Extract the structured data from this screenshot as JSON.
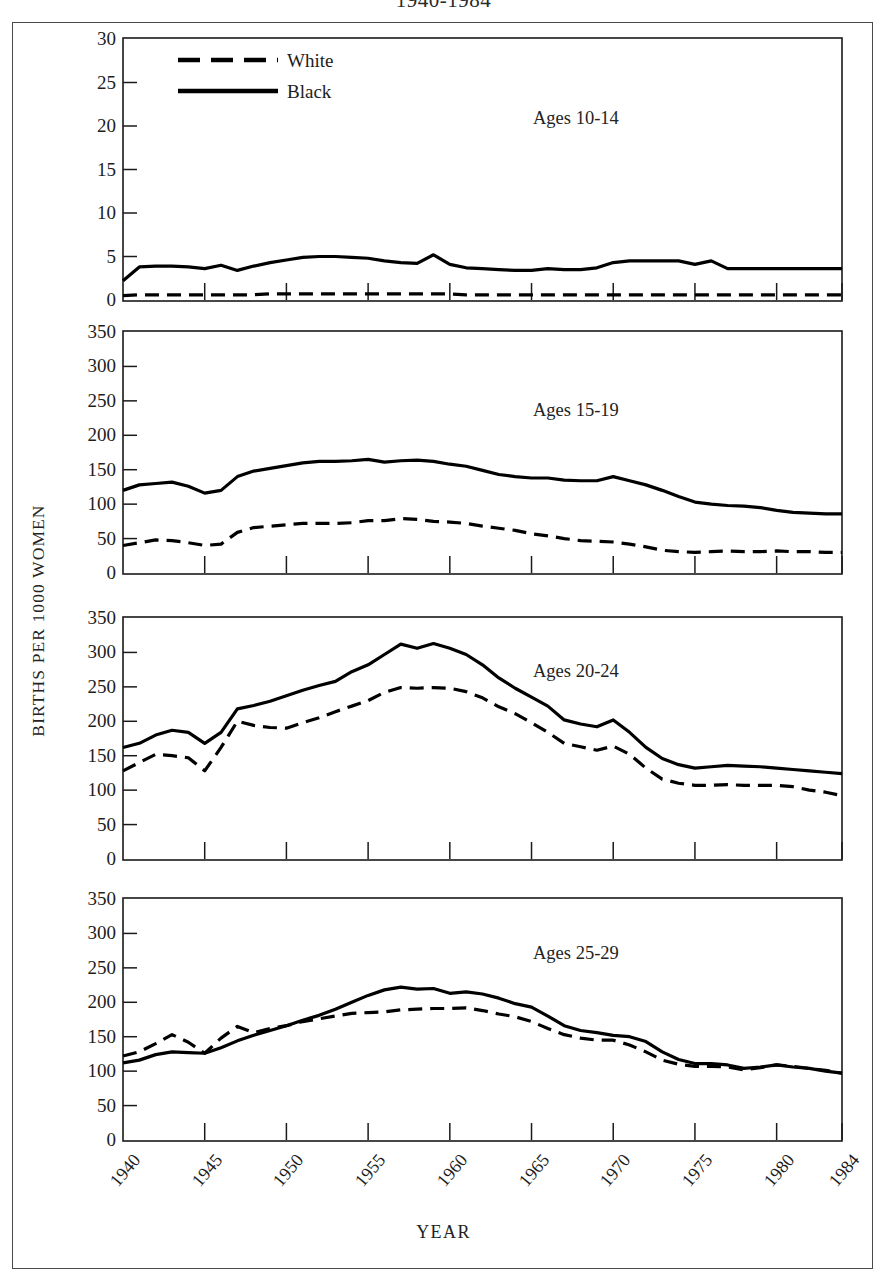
{
  "figure": {
    "title": "1940-1984",
    "ylabel": "BIRTHS PER 1000 WOMEN",
    "xlabel": "YEAR"
  },
  "legend": {
    "white_label": "White",
    "black_label": "Black"
  },
  "panel_notes": {
    "p1": "Ages 10-14",
    "p2": "Ages 15-19",
    "p3": "Ages 20-24",
    "p4": "Ages 25-29"
  },
  "axis": {
    "x_ticks": [
      "1940",
      "1945",
      "1950",
      "1955",
      "1960",
      "1965",
      "1970",
      "1975",
      "1980",
      "1984"
    ],
    "y_ticks_p1": [
      "0",
      "5",
      "10",
      "15",
      "20",
      "25",
      "30"
    ],
    "y_ticks_big": [
      "0",
      "50",
      "100",
      "150",
      "200",
      "250",
      "300",
      "350"
    ]
  },
  "chart_data": [
    {
      "type": "line",
      "title": "Ages 10-14",
      "subtitle": "1940-1984",
      "xlabel": "YEAR",
      "ylabel": "BIRTHS PER 1000 WOMEN",
      "xlim": [
        1940,
        1984
      ],
      "ylim": [
        0,
        30
      ],
      "yticks": [
        0,
        5,
        10,
        15,
        20,
        25,
        30
      ],
      "xticks": [
        1940,
        1945,
        1950,
        1955,
        1960,
        1965,
        1970,
        1975,
        1980,
        1984
      ],
      "grid": false,
      "legend_position": "top-left (shared, panel 1)",
      "x": [
        1940,
        1941,
        1942,
        1943,
        1944,
        1945,
        1946,
        1947,
        1948,
        1949,
        1950,
        1951,
        1952,
        1953,
        1954,
        1955,
        1956,
        1957,
        1958,
        1959,
        1960,
        1961,
        1962,
        1963,
        1964,
        1965,
        1966,
        1967,
        1968,
        1969,
        1970,
        1971,
        1972,
        1973,
        1974,
        1975,
        1976,
        1977,
        1978,
        1979,
        1980,
        1981,
        1982,
        1983,
        1984
      ],
      "series": [
        {
          "name": "Black",
          "style": "solid",
          "color": "#000000",
          "values": [
            2.2,
            3.8,
            3.9,
            3.9,
            3.8,
            3.6,
            4.0,
            3.4,
            3.9,
            4.3,
            4.6,
            4.9,
            5.0,
            5.0,
            4.9,
            4.8,
            4.5,
            4.3,
            4.2,
            5.2,
            4.1,
            3.7,
            3.6,
            3.5,
            3.4,
            3.4,
            3.6,
            3.5,
            3.5,
            3.7,
            4.3,
            4.5,
            4.5,
            4.5,
            4.5,
            4.1,
            4.5,
            3.6,
            3.6,
            3.6,
            3.6,
            3.6,
            3.6,
            3.6,
            3.6
          ]
        },
        {
          "name": "White",
          "style": "dashed",
          "color": "#000000",
          "values": [
            0.5,
            0.6,
            0.6,
            0.6,
            0.6,
            0.6,
            0.6,
            0.6,
            0.6,
            0.7,
            0.7,
            0.7,
            0.7,
            0.7,
            0.7,
            0.7,
            0.7,
            0.7,
            0.7,
            0.7,
            0.7,
            0.6,
            0.6,
            0.6,
            0.6,
            0.6,
            0.6,
            0.6,
            0.6,
            0.6,
            0.6,
            0.6,
            0.6,
            0.6,
            0.6,
            0.6,
            0.6,
            0.6,
            0.6,
            0.6,
            0.6,
            0.6,
            0.6,
            0.6,
            0.6
          ]
        }
      ]
    },
    {
      "type": "line",
      "title": "Ages 15-19",
      "xlabel": "YEAR",
      "ylabel": "BIRTHS PER 1000 WOMEN",
      "xlim": [
        1940,
        1984
      ],
      "ylim": [
        0,
        350
      ],
      "yticks": [
        0,
        50,
        100,
        150,
        200,
        250,
        300,
        350
      ],
      "xticks": [
        1940,
        1945,
        1950,
        1955,
        1960,
        1965,
        1970,
        1975,
        1980,
        1984
      ],
      "grid": false,
      "x": [
        1940,
        1941,
        1942,
        1943,
        1944,
        1945,
        1946,
        1947,
        1948,
        1949,
        1950,
        1951,
        1952,
        1953,
        1954,
        1955,
        1956,
        1957,
        1958,
        1959,
        1960,
        1961,
        1962,
        1963,
        1964,
        1965,
        1966,
        1967,
        1968,
        1969,
        1970,
        1971,
        1972,
        1973,
        1974,
        1975,
        1976,
        1977,
        1978,
        1979,
        1980,
        1981,
        1982,
        1983,
        1984
      ],
      "series": [
        {
          "name": "Black",
          "style": "solid",
          "color": "#000000",
          "values": [
            120,
            128,
            130,
            132,
            126,
            116,
            120,
            140,
            148,
            152,
            156,
            160,
            162,
            162,
            163,
            165,
            161,
            163,
            164,
            162,
            158,
            155,
            149,
            143,
            140,
            138,
            138,
            135,
            134,
            134,
            140,
            134,
            128,
            120,
            111,
            103,
            100,
            98,
            97,
            95,
            91,
            88,
            87,
            86,
            86
          ]
        },
        {
          "name": "White",
          "style": "dashed",
          "color": "#000000",
          "values": [
            40,
            44,
            48,
            47,
            44,
            40,
            42,
            59,
            66,
            68,
            70,
            72,
            72,
            72,
            73,
            76,
            76,
            79,
            78,
            75,
            74,
            72,
            68,
            65,
            62,
            57,
            54,
            50,
            47,
            46,
            45,
            42,
            38,
            33,
            31,
            30,
            31,
            32,
            31,
            31,
            32,
            31,
            31,
            30,
            30
          ]
        }
      ]
    },
    {
      "type": "line",
      "title": "Ages 20-24",
      "xlabel": "YEAR",
      "ylabel": "BIRTHS PER 1000 WOMEN",
      "xlim": [
        1940,
        1984
      ],
      "ylim": [
        0,
        350
      ],
      "yticks": [
        0,
        50,
        100,
        150,
        200,
        250,
        300,
        350
      ],
      "xticks": [
        1940,
        1945,
        1950,
        1955,
        1960,
        1965,
        1970,
        1975,
        1980,
        1984
      ],
      "grid": false,
      "x": [
        1940,
        1941,
        1942,
        1943,
        1944,
        1945,
        1946,
        1947,
        1948,
        1949,
        1950,
        1951,
        1952,
        1953,
        1954,
        1955,
        1956,
        1957,
        1958,
        1959,
        1960,
        1961,
        1962,
        1963,
        1964,
        1965,
        1966,
        1967,
        1968,
        1969,
        1970,
        1971,
        1972,
        1973,
        1974,
        1975,
        1976,
        1977,
        1978,
        1979,
        1980,
        1981,
        1982,
        1983,
        1984
      ],
      "series": [
        {
          "name": "Black",
          "style": "solid",
          "color": "#000000",
          "values": [
            162,
            168,
            180,
            187,
            184,
            168,
            184,
            218,
            223,
            229,
            237,
            245,
            252,
            258,
            272,
            282,
            297,
            312,
            306,
            313,
            306,
            297,
            282,
            263,
            248,
            235,
            222,
            202,
            196,
            192,
            202,
            184,
            162,
            146,
            137,
            132,
            134,
            136,
            135,
            134,
            132,
            130,
            128,
            126,
            124
          ]
        },
        {
          "name": "White",
          "style": "dashed",
          "color": "#000000",
          "values": [
            128,
            140,
            152,
            150,
            147,
            128,
            162,
            200,
            194,
            191,
            190,
            198,
            205,
            214,
            222,
            230,
            242,
            249,
            248,
            249,
            248,
            243,
            234,
            221,
            211,
            198,
            184,
            168,
            163,
            158,
            164,
            152,
            132,
            116,
            110,
            107,
            107,
            108,
            107,
            107,
            107,
            105,
            100,
            97,
            92
          ]
        }
      ]
    },
    {
      "type": "line",
      "title": "Ages 25-29",
      "xlabel": "YEAR",
      "ylabel": "BIRTHS PER 1000 WOMEN",
      "xlim": [
        1940,
        1984
      ],
      "ylim": [
        0,
        350
      ],
      "yticks": [
        0,
        50,
        100,
        150,
        200,
        250,
        300,
        350
      ],
      "xticks": [
        1940,
        1945,
        1950,
        1955,
        1960,
        1965,
        1970,
        1975,
        1980,
        1984
      ],
      "grid": false,
      "x": [
        1940,
        1941,
        1942,
        1943,
        1944,
        1945,
        1946,
        1947,
        1948,
        1949,
        1950,
        1951,
        1952,
        1953,
        1954,
        1955,
        1956,
        1957,
        1958,
        1959,
        1960,
        1961,
        1962,
        1963,
        1964,
        1965,
        1966,
        1967,
        1968,
        1969,
        1970,
        1971,
        1972,
        1973,
        1974,
        1975,
        1976,
        1977,
        1978,
        1979,
        1980,
        1981,
        1982,
        1983,
        1984
      ],
      "series": [
        {
          "name": "Black",
          "style": "solid",
          "color": "#000000",
          "values": [
            112,
            116,
            124,
            128,
            127,
            126,
            134,
            144,
            152,
            159,
            166,
            174,
            181,
            190,
            200,
            210,
            218,
            222,
            219,
            220,
            213,
            215,
            212,
            206,
            198,
            193,
            180,
            166,
            159,
            156,
            152,
            150,
            143,
            128,
            117,
            111,
            111,
            109,
            104,
            106,
            109,
            106,
            104,
            100,
            97
          ]
        },
        {
          "name": "White",
          "style": "dashed",
          "color": "#000000",
          "values": [
            122,
            128,
            140,
            153,
            142,
            126,
            148,
            165,
            156,
            162,
            166,
            172,
            176,
            180,
            184,
            185,
            186,
            189,
            190,
            191,
            191,
            192,
            188,
            183,
            179,
            172,
            162,
            153,
            148,
            145,
            145,
            138,
            128,
            116,
            110,
            107,
            107,
            106,
            102,
            105,
            109,
            107,
            104,
            101,
            97
          ]
        }
      ]
    }
  ]
}
